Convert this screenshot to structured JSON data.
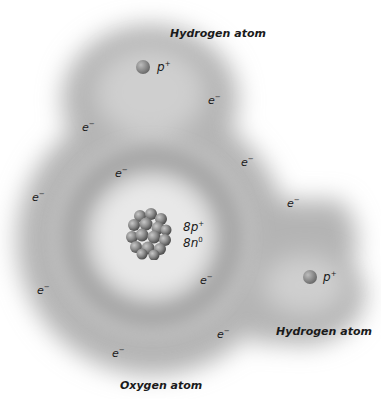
{
  "diagram": {
    "type": "water-molecule-electron-cloud",
    "labels": {
      "hydrogen_top": "Hydrogen atom",
      "hydrogen_right": "Hydrogen atom",
      "oxygen": "Oxygen atom"
    },
    "protons": [
      {
        "label_base": "p",
        "label_sup": "+"
      },
      {
        "label_base": "p",
        "label_sup": "+"
      }
    ],
    "nucleus": {
      "protons_base": "8p",
      "protons_sup": "+",
      "neutrons_base": "8n",
      "neutrons_sup": "0"
    },
    "electrons": [
      {
        "base": "e",
        "sup": "−"
      },
      {
        "base": "e",
        "sup": "−"
      },
      {
        "base": "e",
        "sup": "−"
      },
      {
        "base": "e",
        "sup": "−"
      },
      {
        "base": "e",
        "sup": "−"
      },
      {
        "base": "e",
        "sup": "−"
      },
      {
        "base": "e",
        "sup": "−"
      },
      {
        "base": "e",
        "sup": "−"
      },
      {
        "base": "e",
        "sup": "−"
      },
      {
        "base": "e",
        "sup": "−"
      }
    ],
    "colors": {
      "cloud": "#9a9a9a",
      "background": "#ffffff",
      "text": "#1a1a1a"
    }
  }
}
